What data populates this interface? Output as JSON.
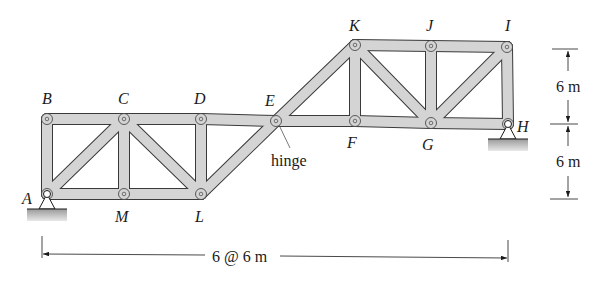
{
  "figure": {
    "joints": [
      {
        "id": "A",
        "x": 47,
        "y": 194,
        "lx": 22,
        "ly": 204
      },
      {
        "id": "B",
        "x": 47,
        "y": 119,
        "lx": 42,
        "ly": 104
      },
      {
        "id": "C",
        "x": 124,
        "y": 119,
        "lx": 118,
        "ly": 104
      },
      {
        "id": "D",
        "x": 201,
        "y": 119,
        "lx": 194,
        "ly": 104
      },
      {
        "id": "E",
        "x": 276,
        "y": 121,
        "lx": 265,
        "ly": 106
      },
      {
        "id": "F",
        "x": 355,
        "y": 121,
        "lx": 347,
        "ly": 148
      },
      {
        "id": "G",
        "x": 431,
        "y": 123,
        "lx": 422,
        "ly": 150
      },
      {
        "id": "H",
        "x": 508,
        "y": 124,
        "lx": 517,
        "ly": 132
      },
      {
        "id": "I",
        "x": 507,
        "y": 47,
        "lx": 505,
        "ly": 31
      },
      {
        "id": "J",
        "x": 431,
        "y": 46,
        "lx": 426,
        "ly": 31
      },
      {
        "id": "K",
        "x": 355,
        "y": 45,
        "lx": 349,
        "ly": 31
      },
      {
        "id": "L",
        "x": 201,
        "y": 194,
        "lx": 195,
        "ly": 222
      },
      {
        "id": "M",
        "x": 124,
        "y": 194,
        "lx": 115,
        "ly": 222
      }
    ],
    "members": [
      [
        "A",
        "B"
      ],
      [
        "B",
        "C"
      ],
      [
        "A",
        "C"
      ],
      [
        "A",
        "M"
      ],
      [
        "C",
        "M"
      ],
      [
        "M",
        "L"
      ],
      [
        "C",
        "L"
      ],
      [
        "C",
        "D"
      ],
      [
        "D",
        "L"
      ],
      [
        "D",
        "E"
      ],
      [
        "L",
        "E"
      ],
      [
        "E",
        "K"
      ],
      [
        "E",
        "F"
      ],
      [
        "K",
        "F"
      ],
      [
        "F",
        "G"
      ],
      [
        "K",
        "G"
      ],
      [
        "K",
        "J"
      ],
      [
        "J",
        "G"
      ],
      [
        "J",
        "I"
      ],
      [
        "G",
        "I"
      ],
      [
        "G",
        "H"
      ],
      [
        "I",
        "H"
      ]
    ],
    "supports": [
      {
        "joint": "A",
        "type": "pin"
      },
      {
        "joint": "H",
        "type": "pin"
      }
    ],
    "hinge_label": "hinge",
    "dimensions": {
      "horizontal": "6 @ 6 m",
      "vertical_upper": "6 m",
      "vertical_lower": "6 m"
    },
    "colors": {
      "member_fill": "#d4d4d4",
      "member_stroke": "#3a3a3a",
      "ground": "#b0b0b0"
    }
  }
}
